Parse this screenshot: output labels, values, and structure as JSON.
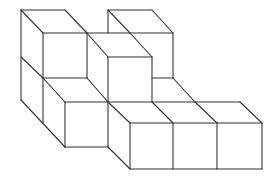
{
  "diagram": {
    "title": "",
    "stroke_color": "#333333",
    "background": "#ffffff",
    "cube_count": 9,
    "edges": [
      [
        21,
        10,
        65,
        10
      ],
      [
        21,
        10,
        43,
        33
      ],
      [
        65,
        10,
        87,
        33
      ],
      [
        43,
        33,
        87,
        33
      ],
      [
        21,
        10,
        21,
        100
      ],
      [
        43,
        33,
        43,
        123
      ],
      [
        87,
        33,
        87,
        78
      ],
      [
        21,
        57,
        43,
        78
      ],
      [
        43,
        78,
        87,
        78
      ],
      [
        87,
        78,
        108,
        102
      ],
      [
        21,
        100,
        65,
        147
      ],
      [
        65,
        102,
        65,
        147
      ],
      [
        65,
        102,
        108,
        102
      ],
      [
        43,
        78,
        65,
        102
      ],
      [
        108,
        10,
        152,
        10
      ],
      [
        108,
        10,
        130,
        33
      ],
      [
        152,
        10,
        173,
        33
      ],
      [
        87,
        33,
        173,
        33
      ],
      [
        173,
        33,
        173,
        78
      ],
      [
        108,
        10,
        108,
        33
      ],
      [
        87,
        33,
        108,
        57
      ],
      [
        108,
        57,
        152,
        57
      ],
      [
        130,
        33,
        152,
        57
      ],
      [
        108,
        57,
        108,
        147
      ],
      [
        152,
        57,
        152,
        102
      ],
      [
        152,
        78,
        173,
        78
      ],
      [
        173,
        78,
        195,
        102
      ],
      [
        108,
        102,
        130,
        123
      ],
      [
        108,
        102,
        240,
        102
      ],
      [
        152,
        102,
        173,
        123
      ],
      [
        195,
        102,
        217,
        123
      ],
      [
        240,
        102,
        262,
        123
      ],
      [
        130,
        123,
        262,
        123
      ],
      [
        130,
        123,
        130,
        169
      ],
      [
        173,
        123,
        173,
        169
      ],
      [
        217,
        123,
        217,
        169
      ],
      [
        262,
        123,
        262,
        169
      ],
      [
        130,
        169,
        262,
        169
      ],
      [
        108,
        147,
        130,
        169
      ],
      [
        65,
        147,
        108,
        147
      ]
    ]
  }
}
